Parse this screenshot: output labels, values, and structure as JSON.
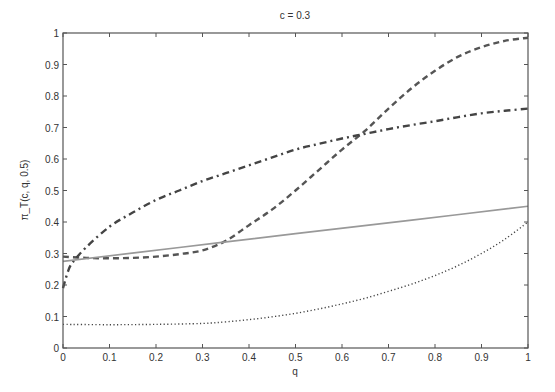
{
  "chart_data": {
    "type": "line",
    "title": "c = 0.3",
    "xlabel": "q",
    "ylabel": "π_T(c, q, 0.5)",
    "xlim": [
      0,
      1
    ],
    "ylim": [
      0,
      1
    ],
    "xticks": [
      "0",
      "0.1",
      "0.2",
      "0.3",
      "0.4",
      "0.5",
      "0.6",
      "0.7",
      "0.8",
      "0.9",
      "1"
    ],
    "yticks": [
      "0",
      "0.1",
      "0.2",
      "0.3",
      "0.4",
      "0.5",
      "0.6",
      "0.7",
      "0.8",
      "0.9",
      "1"
    ],
    "grid": false,
    "legend": null,
    "series": [
      {
        "name": "dashed",
        "style": "dashed",
        "color": "#555555",
        "x": [
          0,
          0.05,
          0.1,
          0.15,
          0.2,
          0.25,
          0.3,
          0.35,
          0.4,
          0.45,
          0.5,
          0.55,
          0.6,
          0.65,
          0.7,
          0.75,
          0.8,
          0.85,
          0.9,
          0.95,
          1.0
        ],
        "y": [
          0.29,
          0.286,
          0.285,
          0.286,
          0.29,
          0.298,
          0.31,
          0.34,
          0.39,
          0.44,
          0.5,
          0.565,
          0.63,
          0.69,
          0.76,
          0.825,
          0.88,
          0.925,
          0.955,
          0.975,
          0.985
        ]
      },
      {
        "name": "dash-dot",
        "style": "dashdot",
        "color": "#444444",
        "x": [
          0,
          0.01,
          0.02,
          0.05,
          0.1,
          0.15,
          0.2,
          0.25,
          0.3,
          0.35,
          0.4,
          0.45,
          0.5,
          0.55,
          0.6,
          0.65,
          0.7,
          0.75,
          0.8,
          0.85,
          0.9,
          0.95,
          1.0
        ],
        "y": [
          0.19,
          0.24,
          0.27,
          0.32,
          0.385,
          0.43,
          0.47,
          0.5,
          0.53,
          0.555,
          0.58,
          0.605,
          0.63,
          0.648,
          0.665,
          0.68,
          0.695,
          0.708,
          0.72,
          0.733,
          0.745,
          0.753,
          0.76
        ]
      },
      {
        "name": "solid",
        "style": "solid",
        "color": "#999999",
        "x": [
          0,
          0.25,
          0.5,
          0.75,
          1.0
        ],
        "y": [
          0.275,
          0.319,
          0.363,
          0.406,
          0.45
        ]
      },
      {
        "name": "dotted",
        "style": "dotted",
        "color": "#444444",
        "x": [
          0,
          0.1,
          0.2,
          0.3,
          0.35,
          0.4,
          0.45,
          0.5,
          0.55,
          0.6,
          0.65,
          0.7,
          0.75,
          0.8,
          0.85,
          0.9,
          0.95,
          1.0
        ],
        "y": [
          0.075,
          0.074,
          0.075,
          0.078,
          0.083,
          0.09,
          0.099,
          0.11,
          0.124,
          0.14,
          0.158,
          0.18,
          0.203,
          0.23,
          0.262,
          0.3,
          0.345,
          0.4
        ]
      }
    ]
  }
}
